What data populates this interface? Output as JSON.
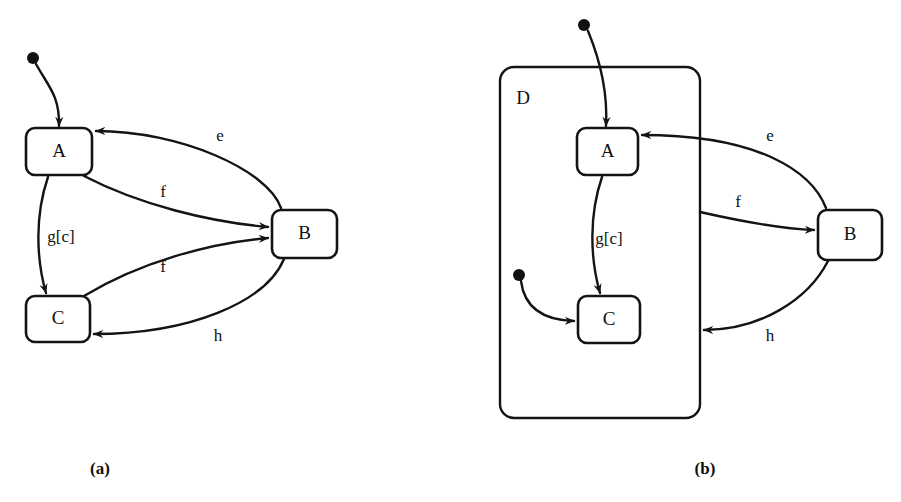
{
  "figure": {
    "kind": "uml-state-machine-diagram",
    "background_color": "#ffffff",
    "line_color": "#141414",
    "panels": [
      {
        "id": "a",
        "caption": "(a)",
        "caption_x": 100,
        "caption_y": 470,
        "states": [
          {
            "id": "A",
            "label": "A",
            "x": 26,
            "y": 128,
            "w": 66,
            "h": 47,
            "rx": 9
          },
          {
            "id": "B",
            "label": "B",
            "x": 272,
            "y": 210,
            "w": 65,
            "h": 48,
            "rx": 9
          },
          {
            "id": "C",
            "label": "C",
            "x": 26,
            "y": 296,
            "w": 64,
            "h": 46,
            "rx": 9
          }
        ],
        "initial_pseudostates": [
          {
            "id": "init-a",
            "cx": 33,
            "cy": 58,
            "r": 6
          }
        ],
        "transitions": [
          {
            "id": "init-to-a",
            "label": "",
            "from": "init-a",
            "to": "A",
            "path": "M 36 64 C 48 86 60 96 59 126"
          },
          {
            "id": "b-to-a-e",
            "label": "e",
            "from": "B",
            "to": "A",
            "label_x": 220,
            "label_y": 137,
            "path": "M 281 208 C 268 170 180 131 96 131"
          },
          {
            "id": "a-to-b-f",
            "label": "f",
            "from": "A",
            "to": "B",
            "label_x": 163,
            "label_y": 193,
            "path": "M 84 176 C 140 205 210 222 268 227"
          },
          {
            "id": "a-to-c-g",
            "label": "g[c]",
            "from": "A",
            "to": "C",
            "label_x": 61,
            "label_y": 238,
            "path": "M 48 177 C 35 215 36 258 46 293"
          },
          {
            "id": "c-to-b-f",
            "label": "f",
            "from": "C",
            "to": "B",
            "label_x": 163,
            "label_y": 268,
            "path": "M 84 296 C 140 262 210 243 268 238"
          },
          {
            "id": "b-to-c-h",
            "label": "h",
            "from": "B",
            "to": "C",
            "label_x": 218,
            "label_y": 337,
            "path": "M 284 259 C 266 302 190 334 94 334"
          }
        ]
      },
      {
        "id": "b",
        "caption": "(b)",
        "caption_x": 705,
        "caption_y": 470,
        "composite_region": {
          "id": "D",
          "label": "D",
          "x": 500,
          "y": 67,
          "w": 200,
          "h": 351,
          "rx": 14,
          "label_x": 523,
          "label_y": 100
        },
        "states": [
          {
            "id": "A",
            "label": "A",
            "x": 577,
            "y": 128,
            "w": 61,
            "h": 47,
            "rx": 9
          },
          {
            "id": "B",
            "label": "B",
            "x": 818,
            "y": 210,
            "w": 64,
            "h": 50,
            "rx": 9
          },
          {
            "id": "C",
            "label": "C",
            "x": 578,
            "y": 296,
            "w": 62,
            "h": 47,
            "rx": 9
          }
        ],
        "initial_pseudostates": [
          {
            "id": "init-b-outer",
            "cx": 584,
            "cy": 25,
            "r": 6
          },
          {
            "id": "init-b-inner",
            "cx": 519,
            "cy": 275,
            "r": 6
          }
        ],
        "transitions": [
          {
            "id": "init-to-a",
            "label": "",
            "from": "init-b-outer",
            "to": "A",
            "path": "M 588 31 C 600 60 608 90 606 126"
          },
          {
            "id": "init-to-c",
            "label": "",
            "from": "init-b-inner",
            "to": "C",
            "path": "M 521 281 C 524 305 540 320 574 321"
          },
          {
            "id": "b-to-a-e",
            "label": "e",
            "from": "B",
            "to": "A",
            "label_x": 770,
            "label_y": 137,
            "path": "M 826 208 C 812 172 760 135 642 135"
          },
          {
            "id": "a-to-b-f",
            "label": "f",
            "from": "D",
            "to": "B",
            "label_x": 738,
            "label_y": 203,
            "path": "M 700 212 C 740 221 780 229 814 230"
          },
          {
            "id": "a-to-c-g",
            "label": "g[c]",
            "from": "A",
            "to": "C",
            "label_x": 609,
            "label_y": 240,
            "path": "M 602 177 C 589 215 590 258 600 293"
          },
          {
            "id": "b-to-d-h",
            "label": "h",
            "from": "B",
            "to": "D",
            "label_x": 770,
            "label_y": 337,
            "path": "M 828 261 C 808 300 760 330 704 330"
          }
        ]
      }
    ]
  }
}
